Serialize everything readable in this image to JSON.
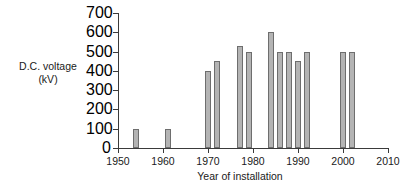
{
  "chart_data": {
    "type": "bar",
    "title": "",
    "xlabel": "Year of installation",
    "ylabel": "D.C. voltage (kV)",
    "ylabel_line1": "D.C. voltage",
    "ylabel_line2": "(kV)",
    "xlim": [
      1950,
      2010
    ],
    "ylim": [
      0,
      700
    ],
    "grid": false,
    "legend": "none",
    "y_ticks": [
      0,
      100,
      200,
      300,
      400,
      500,
      600,
      700
    ],
    "y_tick_labels": [
      "0",
      "100",
      "200",
      "300",
      "400",
      "500",
      "600",
      "700"
    ],
    "x_ticks": [
      1950,
      1960,
      1970,
      1980,
      1990,
      2000,
      2010
    ],
    "x_tick_labels": [
      "1950",
      "1960",
      "1970",
      "1980",
      "1990",
      "2000",
      "2010"
    ],
    "categories": [
      1954,
      1961,
      1970,
      1972,
      1977,
      1979,
      1984,
      1986,
      1988,
      1990,
      1992,
      2000,
      2002
    ],
    "values": [
      100,
      100,
      400,
      450,
      530,
      500,
      600,
      500,
      500,
      450,
      500,
      500,
      500
    ],
    "bars": [
      {
        "year": 1954,
        "value": 100
      },
      {
        "year": 1961,
        "value": 100
      },
      {
        "year": 1970,
        "value": 400
      },
      {
        "year": 1972,
        "value": 450
      },
      {
        "year": 1977,
        "value": 530
      },
      {
        "year": 1979,
        "value": 500
      },
      {
        "year": 1984,
        "value": 600
      },
      {
        "year": 1986,
        "value": 500
      },
      {
        "year": 1988,
        "value": 500
      },
      {
        "year": 1990,
        "value": 450
      },
      {
        "year": 1992,
        "value": 500
      },
      {
        "year": 2000,
        "value": 500
      },
      {
        "year": 2002,
        "value": 500
      }
    ],
    "colors": {
      "bar_fill": "#b4b4b4",
      "bar_stroke": "#6e6e6e",
      "axis": "#3a3a3a",
      "text": "#1a1a1a",
      "background": "#ffffff"
    }
  }
}
